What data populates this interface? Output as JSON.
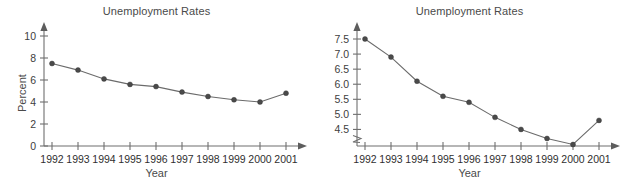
{
  "figure": {
    "panels": [
      {
        "id": "left",
        "title": "Unemployment Rates",
        "xlabel": "Year",
        "ylabel": "Percent"
      },
      {
        "id": "right",
        "title": "Unemployment Rates",
        "xlabel": "Year",
        "ylabel": "Percent"
      }
    ]
  },
  "chart_data": [
    {
      "type": "line",
      "title": "Unemployment Rates",
      "xlabel": "Year",
      "ylabel": "Percent",
      "categories": [
        "1992",
        "1993",
        "1994",
        "1995",
        "1996",
        "1997",
        "1998",
        "1999",
        "2000",
        "2001"
      ],
      "values": [
        7.5,
        6.9,
        6.1,
        5.6,
        5.4,
        4.9,
        4.5,
        4.2,
        4.0,
        4.8
      ],
      "ylim": [
        0,
        10
      ],
      "yticks": [
        "0",
        "2",
        "4",
        "6",
        "8",
        "10"
      ],
      "ytick_values": [
        0,
        2,
        4,
        6,
        8,
        10
      ],
      "xticks": [
        "1992",
        "1993",
        "1994",
        "1995",
        "1996",
        "1997",
        "1998",
        "1999",
        "2000",
        "2001"
      ],
      "grid": false,
      "legend": false,
      "axis_break": false,
      "marker": "filled-circle",
      "line_color": "#6b6b6b",
      "marker_color": "#4a4a4a",
      "axis_color": "#6f6f6f",
      "background": "#ffffff"
    },
    {
      "type": "line",
      "title": "Unemployment Rates",
      "xlabel": "Year",
      "ylabel": "Percent",
      "categories": [
        "1992",
        "1993",
        "1994",
        "1995",
        "1996",
        "1997",
        "1998",
        "1999",
        "2000",
        "2001"
      ],
      "values": [
        7.5,
        6.9,
        6.1,
        5.6,
        5.4,
        4.9,
        4.5,
        4.2,
        4.0,
        4.8
      ],
      "ylim": [
        3.95,
        7.6
      ],
      "yticks": [
        "4.5",
        "5.0",
        "5.5",
        "6.0",
        "6.5",
        "7.0",
        "7.5"
      ],
      "ytick_values": [
        4.5,
        5.0,
        5.5,
        6.0,
        6.5,
        7.0,
        7.5
      ],
      "xticks": [
        "1992",
        "1993",
        "1994",
        "1995",
        "1996",
        "1997",
        "1998",
        "1999",
        "2000",
        "2001"
      ],
      "grid": false,
      "legend": false,
      "axis_break": true,
      "axis_break_note": "zigzag break on y-axis below 4.5",
      "marker": "filled-circle",
      "line_color": "#6b6b6b",
      "marker_color": "#4a4a4a",
      "axis_color": "#6f6f6f",
      "background": "#ffffff"
    }
  ]
}
